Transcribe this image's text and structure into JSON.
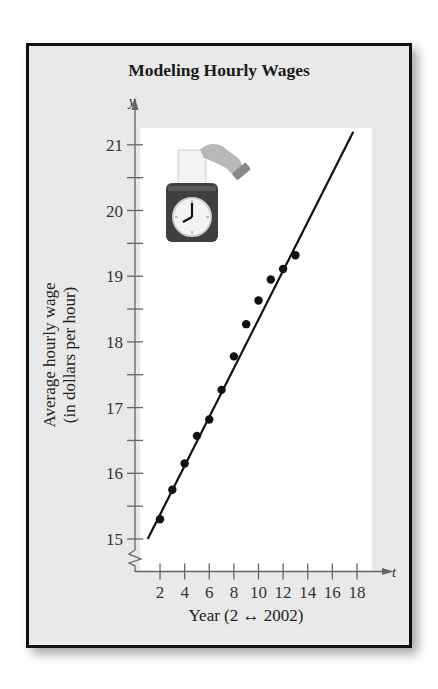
{
  "chart_data": {
    "type": "scatter",
    "title": "Modeling Hourly Wages",
    "xlabel": "Year (2 ↔ 2002)",
    "ylabel": [
      "Average hourly wage",
      "(in dollars per hour)"
    ],
    "x_var": "t",
    "y_var": "y",
    "x_ticks": [
      2,
      4,
      6,
      8,
      10,
      12,
      14,
      16,
      18
    ],
    "x_minor_ticks": [],
    "y_ticks": [
      15,
      16,
      17,
      18,
      19,
      20,
      21
    ],
    "y_half_ticks": [
      15.5,
      16.5,
      17.5,
      18.5,
      19.5,
      20.5
    ],
    "xlim": [
      0,
      19
    ],
    "ylim": [
      14.5,
      21.6
    ],
    "y_axis_break": true,
    "grid": false,
    "legend": null,
    "series": [
      {
        "name": "Average hourly wage (data)",
        "kind": "points",
        "x": [
          2,
          3,
          4,
          5,
          6,
          7,
          8,
          9,
          10,
          11,
          12,
          13
        ],
        "y": [
          15.3,
          15.75,
          16.15,
          16.57,
          16.82,
          17.27,
          17.78,
          18.27,
          18.63,
          18.95,
          19.11,
          19.32
        ]
      },
      {
        "name": "Linear model",
        "kind": "line",
        "x": [
          1,
          17.7
        ],
        "y": [
          15.0,
          21.2
        ]
      }
    ],
    "annotation_icon": "time-clock-punch-card-icon"
  },
  "colors": {
    "frame_bg": "#e9e9e9",
    "plot_bg": "#ffffff",
    "frame_border": "#111111",
    "ink": "#111111",
    "axis": "#666666"
  }
}
